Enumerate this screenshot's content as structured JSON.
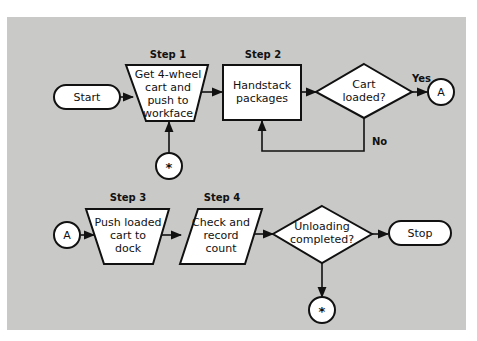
{
  "diagram": {
    "type": "flowchart",
    "colors": {
      "panel": "#c9c9c7",
      "shape_fill": "#ffffff",
      "stroke": "#111111"
    },
    "nodes": {
      "start": {
        "label": "Start",
        "shape": "terminator"
      },
      "step1": {
        "step": "Step 1",
        "lines": [
          "Get 4-wheel",
          "cart and",
          "push to",
          "workface"
        ],
        "shape": "manual-operation"
      },
      "step2": {
        "step": "Step 2",
        "lines": [
          "Handstack",
          "packages"
        ],
        "shape": "process"
      },
      "decision1": {
        "lines": [
          "Cart",
          "loaded?"
        ],
        "shape": "decision"
      },
      "connector_a_out": {
        "label": "A",
        "shape": "connector"
      },
      "connector_star_in": {
        "label": "*",
        "shape": "connector"
      },
      "connector_a_in": {
        "label": "A",
        "shape": "connector"
      },
      "step3": {
        "step": "Step 3",
        "lines": [
          "Push loaded",
          "cart to",
          "dock"
        ],
        "shape": "manual-operation"
      },
      "step4": {
        "step": "Step 4",
        "lines": [
          "Check and",
          "record",
          "count"
        ],
        "shape": "input-output"
      },
      "decision2": {
        "lines": [
          "Unloading",
          "completed?"
        ],
        "shape": "decision"
      },
      "stop": {
        "label": "Stop",
        "shape": "terminator"
      },
      "connector_star_out": {
        "label": "*",
        "shape": "connector"
      }
    },
    "edges": {
      "yes": "Yes",
      "no": "No"
    },
    "connections": [
      [
        "start",
        "step1"
      ],
      [
        "connector_star_in",
        "step1"
      ],
      [
        "step1",
        "step2"
      ],
      [
        "step2",
        "decision1"
      ],
      [
        "decision1",
        "connector_a_out",
        "Yes"
      ],
      [
        "decision1",
        "step2",
        "No"
      ],
      [
        "connector_a_in",
        "step3"
      ],
      [
        "step3",
        "step4"
      ],
      [
        "step4",
        "decision2"
      ],
      [
        "decision2",
        "stop"
      ],
      [
        "decision2",
        "connector_star_out"
      ]
    ]
  }
}
